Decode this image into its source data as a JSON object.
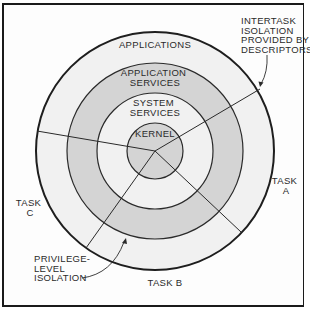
{
  "diagram": {
    "type": "concentric-rings",
    "rings": [
      {
        "id": "applications",
        "label_lines": [
          "APPLICATIONS"
        ],
        "fill": "#f1f1f1"
      },
      {
        "id": "application-services",
        "label_lines": [
          "APPLICATION",
          "SERVICES"
        ],
        "fill": "#d4d4d4"
      },
      {
        "id": "system-services",
        "label_lines": [
          "SYSTEM",
          "SERVICES"
        ],
        "fill": "#f1f1f1"
      },
      {
        "id": "kernel",
        "label_lines": [
          "KERNEL"
        ],
        "fill": "#d4d4d4"
      }
    ],
    "tasks": [
      {
        "id": "task-a",
        "label_lines": [
          "TASK",
          "A"
        ]
      },
      {
        "id": "task-b",
        "label_lines": [
          "TASK B"
        ]
      },
      {
        "id": "task-c",
        "label_lines": [
          "TASK",
          "C"
        ]
      }
    ],
    "annotations": {
      "intertask": {
        "label_lines": [
          "INTERTASK",
          "ISOLATION",
          "PROVIDED BY",
          "DESCRIPTORS"
        ]
      },
      "privilege": {
        "label_lines": [
          "PRIVILEGE-",
          "LEVEL",
          "ISOLATION"
        ]
      }
    },
    "colors": {
      "stroke": "#222222",
      "light_ring": "#f1f1f1",
      "dark_ring": "#d4d4d4",
      "background": "#fdfdfd"
    }
  }
}
